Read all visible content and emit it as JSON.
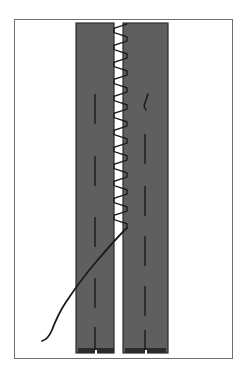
{
  "figure": {
    "caption_artifact": "",
    "background_color": "#ffffff",
    "frame": {
      "label": "figure-border",
      "x": 14,
      "y": 19,
      "width": 218,
      "height": 339,
      "stroke": "#6f6f6f",
      "stroke_width": 1
    },
    "lanes": [
      {
        "label": "left-lane",
        "x": 76,
        "y": 23,
        "width": 38,
        "height": 330,
        "fill": "#5f5f5f",
        "stroke": "#2b2b2b"
      },
      {
        "label": "right-lane",
        "x": 123,
        "y": 23,
        "width": 45,
        "height": 330,
        "fill": "#5f5f5f",
        "stroke": "#2b2b2b"
      }
    ],
    "lane_markings": {
      "label": "dashed-centerlines",
      "color": "#1a1a1a",
      "width": 1.4,
      "left_lane_dashes": [
        {
          "x": 95,
          "y1": 94,
          "y2": 124
        },
        {
          "x": 95,
          "y1": 156,
          "y2": 186
        },
        {
          "x": 95,
          "y1": 217,
          "y2": 247
        },
        {
          "x": 95,
          "y1": 278,
          "y2": 308
        },
        {
          "x": 95,
          "y1": 327,
          "y2": 350
        }
      ],
      "right_lane_dashes": [
        {
          "x": 145,
          "y1": 134,
          "y2": 164
        },
        {
          "x": 145,
          "y1": 186,
          "y2": 216
        },
        {
          "x": 145,
          "y1": 236,
          "y2": 266
        },
        {
          "x": 145,
          "y1": 286,
          "y2": 316
        },
        {
          "x": 145,
          "y1": 330,
          "y2": 350
        }
      ],
      "hook_mark": {
        "label": "bent-dash-mark",
        "points": "148,94 144,106 146,110"
      }
    },
    "zigzag": {
      "label": "sawtooth-boundary",
      "color": "#1a1a1a",
      "width": 1.3,
      "x_left": 114,
      "x_right": 127,
      "y_start": 24,
      "y_end": 228,
      "teeth": 24
    },
    "trajectory": {
      "label": "curved-path",
      "color": "#1a1a1a",
      "width": 1.8,
      "path": "M 127,228 C 120,234 108,248 96,262 C 84,276 74,290 66,302 C 58,314 55,322 52,330 C 49,337 46,340 42,341"
    },
    "lane_feet": [
      {
        "label": "left-lane-foot",
        "x": 78,
        "y": 348,
        "width": 36,
        "height": 5
      },
      {
        "label": "right-lane-foot",
        "x": 125,
        "y": 348,
        "width": 41,
        "height": 5
      }
    ],
    "foot_notches": [
      {
        "label": "left-foot-notch",
        "x": 95,
        "y": 350,
        "width": 2,
        "height": 4
      },
      {
        "label": "right-foot-notch",
        "x": 145,
        "y": 350,
        "width": 2,
        "height": 4
      }
    ],
    "colors": {
      "lane_fill": "#5f5f5f",
      "lane_stroke": "#2b2b2b",
      "ink": "#1a1a1a",
      "frame": "#6f6f6f",
      "paper": "#ffffff"
    },
    "alt_text": "Technical line drawing: two vertical gray lanes separated by a narrow white gap; a sawtooth zigzag line runs down the gap from the top to about two thirds down, then a smooth curved trajectory leaves the gap and sweeps to the lower left. Each lane carries a dashed centerline."
  }
}
